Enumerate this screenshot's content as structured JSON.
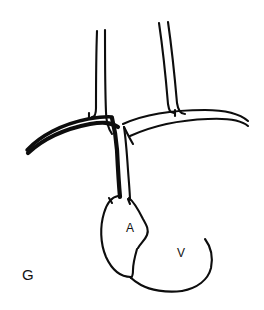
{
  "figure": {
    "panel_letter": "G",
    "background_color": "#ffffff",
    "ink_color": "#0d0d0d",
    "width": 264,
    "height": 310,
    "labels": [
      {
        "id": "atrium",
        "text": "A",
        "x": 131,
        "y": 230
      },
      {
        "id": "ventricle",
        "text": "V",
        "x": 182,
        "y": 255
      },
      {
        "id": "panel",
        "text": "G",
        "x": 28,
        "y": 277
      }
    ]
  },
  "chart_data": {
    "type": "line",
    "title": "G",
    "xlabel": "",
    "ylabel": "",
    "grid": false,
    "legend": "none",
    "xlim": [
      0,
      264
    ],
    "ylim": [
      310,
      0
    ],
    "annotations": [
      {
        "text": "A",
        "x": 131,
        "y": 230
      },
      {
        "text": "V",
        "x": 182,
        "y": 255
      },
      {
        "text": "G",
        "x": 28,
        "y": 277
      }
    ],
    "series": [
      {
        "name": "left-branch-vessel-outer-wall",
        "path": "M 97,31 C 96,58 96,84 96,108 C 96,114 95,117 92,117",
        "weight": "med"
      },
      {
        "name": "left-branch-vessel-inner-wall",
        "path": "M 105,30 C 105,60 105,88 106,112 C 106,122 108,128 112,134",
        "weight": "med"
      },
      {
        "name": "left-branch-vessel-notch",
        "path": "M 89,113 L 89,119",
        "weight": "med"
      },
      {
        "name": "right-branch-vessel-outer-wall",
        "path": "M 159,23 C 163,50 166,80 168,104 C 169,110 170,113 174,113",
        "weight": "med"
      },
      {
        "name": "right-branch-vessel-inner-wall",
        "path": "M 168,22 C 172,50 175,80 177,103 C 178,110 180,114 185,114",
        "weight": "med"
      },
      {
        "name": "right-branch-vessel-notch",
        "path": "M 175,110 L 175,116",
        "weight": "med"
      },
      {
        "name": "arch-upper-wall-left-limb",
        "path": "M 27,150 C 40,136 62,124 88,119 C 100,117 106,116 112,117",
        "weight": "thick"
      },
      {
        "name": "arch-lower-wall-left-limb",
        "path": "M 28,153 C 42,140 64,129 90,124 C 102,122 110,122 118,127",
        "weight": "xthick"
      },
      {
        "name": "arch-upper-wall-right-limb",
        "path": "M 123,124 C 145,114 176,110 205,110 C 225,110 240,114 248,121",
        "weight": "med"
      },
      {
        "name": "arch-lower-wall-right-limb",
        "path": "M 130,136 C 152,126 180,120 208,119 C 228,118 241,120 248,126",
        "weight": "med"
      },
      {
        "name": "descending-vessel-left-wall-thick",
        "path": "M 112,118 C 114,126 116,136 117,150 C 118,170 119,186 120,197",
        "weight": "xthick"
      },
      {
        "name": "descending-vessel-right-wall",
        "path": "M 124,127 C 126,140 127,155 128,170 C 129,184 130,194 130,200",
        "weight": "med"
      },
      {
        "name": "descending-vessel-bifurcation-spur",
        "path": "M 124,127 C 127,133 130,139 133,144",
        "weight": "med"
      },
      {
        "name": "atrium-left-contour",
        "path": "M 118,196 C 112,197 107,203 104,213 C 100,226 100,243 106,257 C 112,270 121,277 131,277",
        "weight": "med"
      },
      {
        "name": "atrium-roof-left-notch",
        "path": "M 109,198 L 112,203",
        "weight": "med"
      },
      {
        "name": "atrium-roof-right-notch",
        "path": "M 128,199 L 130,204",
        "weight": "med"
      },
      {
        "name": "atrium-roof-to-av-groove",
        "path": "M 129,198 C 134,202 139,211 143,219 C 147,226 149,230 147,235 C 145,240 141,243 138,248",
        "weight": "med"
      },
      {
        "name": "av-septum-lower",
        "path": "M 137,249 C 135,256 133,263 133,270 C 133,274 132,277 131,278",
        "weight": "med"
      },
      {
        "name": "ventricle-right-contour",
        "path": "M 205,239 C 211,247 213,258 211,268 C 208,280 197,288 182,291",
        "weight": "med"
      },
      {
        "name": "ventricle-apex-lower-contour",
        "path": "M 182,291 C 166,293 150,290 141,285 C 134,281 131,278 130,277",
        "weight": "med"
      }
    ]
  }
}
